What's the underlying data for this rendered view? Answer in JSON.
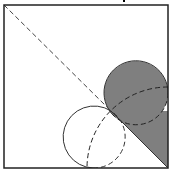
{
  "figure": {
    "type": "geometry-diagram",
    "caption_fragment": "",
    "square": {
      "x": 4,
      "y": 5,
      "size": 164,
      "stroke": "#222222"
    },
    "diagonal": {
      "x1": 4,
      "y1": 5,
      "x2": 168,
      "y2": 168,
      "dashed_until": [
        111,
        111
      ]
    },
    "shaded_triangle_region": {
      "fill": "#7f7f7f"
    },
    "shaded_circle": {
      "cx": 136,
      "cy": 93,
      "r": 32,
      "fill": "#7f7f7f",
      "stroke": "#333333"
    },
    "white_circle": {
      "cx": 93,
      "cy": 137,
      "r": 31,
      "stroke": "#333333"
    },
    "tangent_point": {
      "x": 111,
      "y": 111
    },
    "dashed_arc": {
      "cx": 168,
      "cy": 168,
      "r": 81
    },
    "colors": {
      "shade": "#7f7f7f",
      "line": "#333333",
      "background": "#ffffff"
    }
  }
}
